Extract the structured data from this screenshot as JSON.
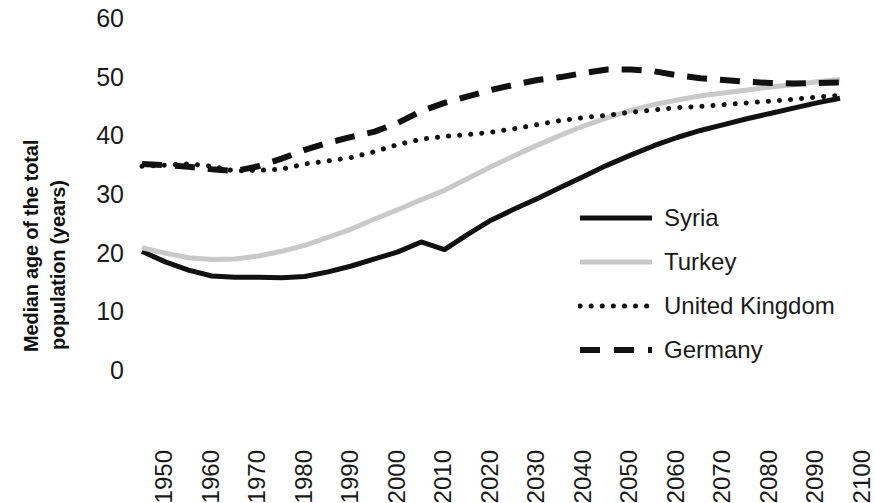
{
  "chart_data": {
    "type": "line",
    "title": "",
    "xlabel": "",
    "ylabel": "Median age of the total population (years)",
    "ylabel_line1": "Median age of the total",
    "ylabel_line2": "population (years)",
    "grid": false,
    "legend_position": "center-right",
    "xlim": [
      1950,
      2100
    ],
    "ylim": [
      0,
      60
    ],
    "ytick_values": [
      60,
      50,
      40,
      30,
      20,
      10,
      0
    ],
    "ytick_labels": [
      "60",
      "50",
      "40",
      "30",
      "20",
      "10",
      "0"
    ],
    "categories": [
      1950,
      1955,
      1960,
      1965,
      1970,
      1975,
      1980,
      1985,
      1990,
      1995,
      2000,
      2005,
      2010,
      2015,
      2020,
      2025,
      2030,
      2035,
      2040,
      2045,
      2050,
      2055,
      2060,
      2065,
      2070,
      2075,
      2080,
      2085,
      2090,
      2095,
      2100
    ],
    "xtick_labels": [
      "1950",
      "1960",
      "1970",
      "1980",
      "1990",
      "2000",
      "2010",
      "2020",
      "2030",
      "2040",
      "2050",
      "2060",
      "2070",
      "2080",
      "2090",
      "2100"
    ],
    "xtick_values": [
      1950,
      1960,
      1970,
      1980,
      1990,
      2000,
      2010,
      2020,
      2030,
      2040,
      2050,
      2060,
      2070,
      2080,
      2090,
      2100
    ],
    "series": [
      {
        "name": "Syria",
        "style": "solid",
        "color": "#111111",
        "width": 5,
        "values": [
          20.4,
          18.6,
          17.2,
          16.2,
          16.0,
          16.0,
          15.9,
          16.1,
          16.9,
          17.9,
          19.1,
          20.3,
          22.0,
          20.7,
          23.3,
          25.7,
          27.6,
          29.4,
          31.3,
          33.2,
          35.1,
          36.8,
          38.4,
          39.8,
          41.0,
          42.0,
          43.0,
          43.9,
          44.8,
          45.7,
          46.5
        ]
      },
      {
        "name": "Turkey",
        "style": "solid",
        "color": "#c9c9c9",
        "width": 5,
        "values": [
          21.0,
          20.1,
          19.3,
          19.0,
          19.1,
          19.6,
          20.4,
          21.4,
          22.8,
          24.2,
          25.9,
          27.5,
          29.2,
          30.8,
          32.8,
          34.8,
          36.7,
          38.5,
          40.2,
          41.8,
          43.2,
          44.4,
          45.4,
          46.2,
          46.9,
          47.4,
          47.9,
          48.4,
          48.8,
          49.3,
          49.7
        ]
      },
      {
        "name": "United Kingdom",
        "style": "dotted",
        "color": "#111111",
        "width": 5,
        "values": [
          34.9,
          35.1,
          35.3,
          34.9,
          34.1,
          34.2,
          34.4,
          35.3,
          35.8,
          36.4,
          37.4,
          38.6,
          39.5,
          40.0,
          40.3,
          40.7,
          41.3,
          42.0,
          42.7,
          43.2,
          43.6,
          44.1,
          44.5,
          44.9,
          45.1,
          45.4,
          45.7,
          46.0,
          46.3,
          46.7,
          47.0
        ]
      },
      {
        "name": "Germany",
        "style": "dashed",
        "color": "#111111",
        "width": 6,
        "values": [
          35.3,
          35.1,
          34.8,
          34.4,
          34.1,
          34.9,
          36.2,
          37.7,
          38.9,
          39.9,
          40.8,
          42.3,
          44.3,
          45.7,
          46.8,
          47.9,
          48.8,
          49.6,
          50.1,
          50.8,
          51.4,
          51.4,
          51.1,
          50.4,
          49.9,
          49.6,
          49.3,
          49.1,
          49.0,
          49.1,
          49.2
        ]
      }
    ]
  },
  "legend": {
    "items": [
      {
        "label": "Syria",
        "style": "solid",
        "color": "#111111"
      },
      {
        "label": "Turkey",
        "style": "solid",
        "color": "#c9c9c9"
      },
      {
        "label": "United Kingdom",
        "style": "dotted",
        "color": "#111111"
      },
      {
        "label": "Germany",
        "style": "dashed",
        "color": "#111111"
      }
    ]
  }
}
